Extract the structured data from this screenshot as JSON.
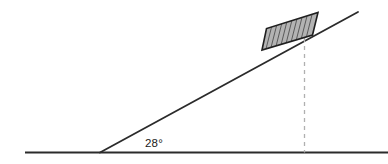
{
  "figure": {
    "background_color": "#ffffff"
  },
  "ground": {
    "name": "horizontal-ground-line",
    "color": "#2b2b2b",
    "x1": 25,
    "y1": 152.5,
    "x2": 388,
    "y2": 152.5,
    "stroke_width": 1.8
  },
  "incline": {
    "name": "incline-surface-line",
    "color": "#2b2b2b",
    "x1": 100,
    "y1": 152.5,
    "x2": 358,
    "y2": 12,
    "stroke_width": 1.8
  },
  "angle": {
    "label": "28°",
    "value": 28,
    "unit": "degrees",
    "vertex_x": 100,
    "vertex_y": 152.5,
    "label_x": 145,
    "label_y": 147,
    "color": "#1a1a1a"
  },
  "block": {
    "name": "hatched-block",
    "fill_color": "#b3b3b3",
    "edge_color": "#1f1f1f",
    "hatch_color": "#5a5a5a",
    "edge_width": 1.6,
    "hatch_width": 1.0,
    "hatch_count": 9,
    "corners": [
      {
        "x": 262.0,
        "y": 50.0
      },
      {
        "x": 266.5,
        "y": 28.5
      },
      {
        "x": 318.0,
        "y": 12.5
      },
      {
        "x": 312.5,
        "y": 35.0
      }
    ]
  },
  "dashed_line": {
    "name": "vertical-dashed-drop-line",
    "color": "#b0b0b0",
    "x": 304.5,
    "y_top": 38,
    "y_bottom": 152.5,
    "stroke_width": 1.3,
    "dash_pattern": "4 4"
  }
}
